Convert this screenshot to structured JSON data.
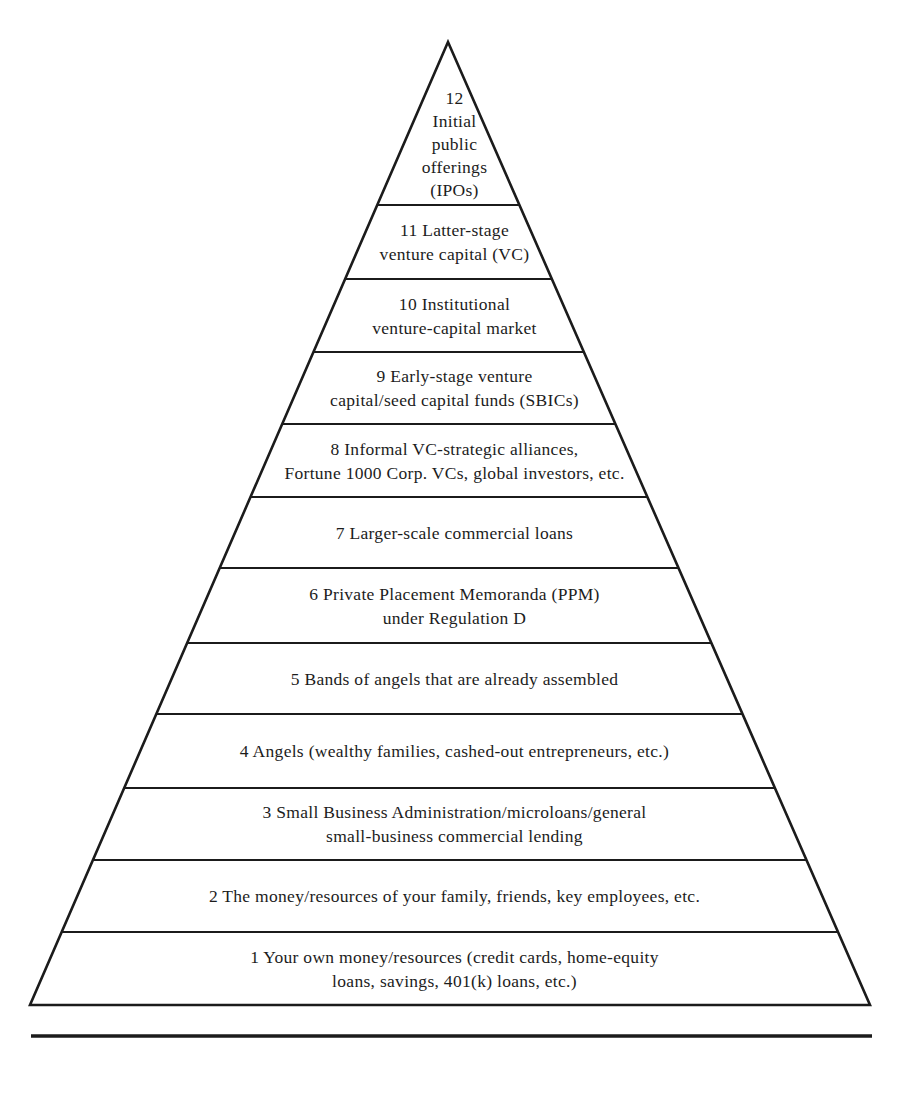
{
  "figure": {
    "type": "pyramid",
    "background_color": "#ffffff",
    "ink_color": "#1b1b1b",
    "levels": [
      {
        "label": "12 Initial public offerings (IPOs)",
        "lines": [
          "12",
          "Initial",
          "public",
          "offerings",
          "(IPOs)"
        ]
      },
      {
        "label": "11 Latter-stage venture capital (VC)",
        "lines": [
          "11 Latter-stage",
          "venture capital (VC)"
        ]
      },
      {
        "label": "10 Institutional venture-capital market",
        "lines": [
          "10 Institutional",
          "venture-capital market"
        ]
      },
      {
        "label": "9 Early-stage venture capital/seed capital funds (SBICs)",
        "lines": [
          "9 Early-stage venture",
          "capital/seed capital funds (SBICs)"
        ]
      },
      {
        "label": "8 Informal VC-strategic alliances, Fortune 1000 Corp. VCs, global investors, etc.",
        "lines": [
          "8 Informal VC-strategic alliances,",
          "Fortune 1000 Corp. VCs, global investors, etc."
        ]
      },
      {
        "label": "7 Larger-scale commercial loans",
        "lines": [
          "7 Larger-scale commercial loans"
        ]
      },
      {
        "label": "6 Private Placement Memoranda (PPM) under Regulation D",
        "lines": [
          "6 Private Placement Memoranda (PPM)",
          "under Regulation D"
        ]
      },
      {
        "label": "5 Bands of angels that are already assembled",
        "lines": [
          "5 Bands of angels that are already assembled"
        ]
      },
      {
        "label": "4 Angels (wealthy families, cashed-out entrepreneurs, etc.)",
        "lines": [
          "4 Angels (wealthy families, cashed-out entrepreneurs, etc.)"
        ]
      },
      {
        "label": "3 Small Business Administration/microloans/general small-business commercial lending",
        "lines": [
          "3 Small Business Administration/microloans/general",
          "small-business commercial lending"
        ]
      },
      {
        "label": "2 The money/resources of your family, friends, key employees, etc.",
        "lines": [
          "2 The money/resources of your family, friends, key employees, etc."
        ]
      },
      {
        "label": "1 Your own money/resources (credit cards, home-equity loans, savings, 401(k) loans, etc.)",
        "lines": [
          "1 Your own money/resources (credit cards, home-equity",
          "loans, savings, 401(k) loans, etc.)"
        ]
      }
    ]
  }
}
